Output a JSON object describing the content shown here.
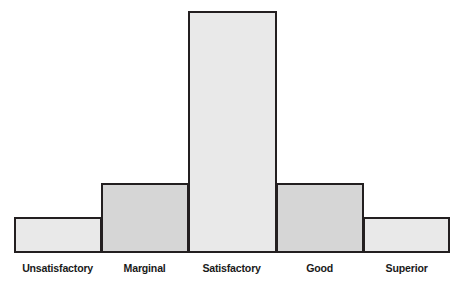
{
  "chart_data": {
    "type": "bar",
    "title": "",
    "subtitle": "",
    "xlabel": "",
    "ylabel": "",
    "categories": [
      "Unsatisfactory",
      "Marginal",
      "Satisfactory",
      "Good",
      "Superior"
    ],
    "values": [
      15,
      29,
      100,
      29,
      15
    ],
    "ylim": [
      0,
      100
    ],
    "grid": false,
    "legend": false,
    "axis_ticks": false,
    "orientation": "vertical",
    "bar_gap": 0,
    "style": {
      "fill_light": "#e9e9e9",
      "fill_dark": "#d6d6d6",
      "outline": "#231f20",
      "background": "#ffffff",
      "label_color": "#1a1a1a"
    },
    "bars": [
      {
        "category": "Unsatisfactory",
        "value": 15,
        "fill": "light"
      },
      {
        "category": "Marginal",
        "value": 29,
        "fill": "dark"
      },
      {
        "category": "Satisfactory",
        "value": 100,
        "fill": "light"
      },
      {
        "category": "Good",
        "value": 29,
        "fill": "dark"
      },
      {
        "category": "Superior",
        "value": 15,
        "fill": "light"
      }
    ]
  },
  "geometry": {
    "plot_left": 14,
    "plot_right": 450,
    "baseline_y": 253,
    "top_y": 11,
    "bar_width": 87
  }
}
